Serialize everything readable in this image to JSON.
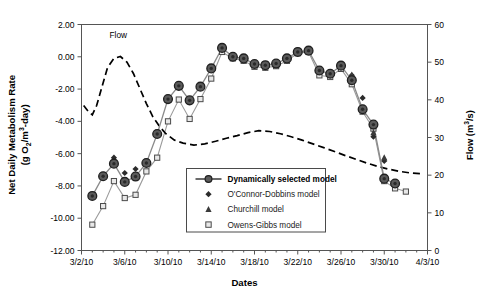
{
  "chart_data": {
    "type": "line",
    "title": "",
    "xlabel": "Dates",
    "ylabel": "Net Daily Metabolism Rate (g O2/m3-day)",
    "ylabel_line1": "Net Daily Metabolism Rate",
    "ylabel_line2": "(g O2/m3-day)",
    "y2label": "Flow (m3/s)",
    "xlim": [
      "3/2/10",
      "4/3/10"
    ],
    "x_tick_labels": [
      "3/2/10",
      "3/6/10",
      "3/10/10",
      "3/14/10",
      "3/18/10",
      "3/22/10",
      "3/26/10",
      "3/30/10",
      "4/3/10"
    ],
    "x_tick_days": [
      0,
      4,
      8,
      12,
      16,
      20,
      24,
      28,
      32
    ],
    "ylim": [
      -12.0,
      2.0
    ],
    "y_tick_labels": [
      "2.00",
      "0.00",
      "-2.00",
      "-4.00",
      "-6.00",
      "-8.00",
      "-10.00",
      "-12.00"
    ],
    "y_tick_values": [
      2.0,
      0.0,
      -2.0,
      -4.0,
      -6.0,
      -8.0,
      -10.0,
      -12.0
    ],
    "y2lim": [
      0,
      60
    ],
    "y2_tick_labels": [
      "60",
      "50",
      "40",
      "30",
      "20",
      "10",
      "0"
    ],
    "y2_tick_values": [
      60,
      50,
      40,
      30,
      20,
      10,
      0
    ],
    "grid": false,
    "legend_position": "lower-center",
    "annotations": [
      {
        "text": "Flow",
        "x": 3.4,
        "y": 1.15
      }
    ],
    "series": [
      {
        "name": "Dynamically selected model",
        "marker": "circle-filled",
        "line": true,
        "color": "#4d4d4d",
        "x": [
          1.0,
          2.0,
          3.0,
          4.0,
          5.0,
          6.0,
          7.0,
          8.0,
          9.0,
          10.0,
          11.0,
          12.0,
          13.0,
          14.0,
          15.0,
          16.0,
          17.0,
          18.0,
          19.0,
          20.0,
          21.0,
          22.0,
          23.0,
          24.0,
          25.0,
          26.0,
          27.0,
          28.0,
          29.0,
          30.0
        ],
        "y": [
          -8.62,
          -7.4,
          -6.62,
          -7.75,
          -7.42,
          -6.58,
          -4.78,
          -2.62,
          -1.8,
          -2.7,
          -1.85,
          -0.72,
          0.55,
          0.0,
          -0.1,
          -0.45,
          -0.52,
          -0.42,
          -0.1,
          0.3,
          0.38,
          -0.85,
          -1.05,
          -0.55,
          -1.45,
          -3.25,
          -4.2,
          -7.55,
          -7.85,
          null
        ]
      },
      {
        "name": "O'Connor-Dobbins model",
        "marker": "diamond",
        "line": false,
        "color": "#2b2b2b",
        "x": [
          2.0,
          3.0,
          4.0,
          5.0,
          6.0,
          25.0,
          26.0,
          27.0,
          28.0
        ],
        "y": [
          -7.4,
          -6.25,
          -7.2,
          -6.95,
          -6.58,
          -1.15,
          -2.55,
          -4.95,
          -6.45
        ]
      },
      {
        "name": "Churchill model",
        "marker": "triangle",
        "line": false,
        "color": "#3a3a3a",
        "x": [
          13.0,
          20.0,
          25.0,
          27.0,
          28.0
        ],
        "y": [
          0.55,
          0.38,
          -1.12,
          -4.7,
          -6.25
        ]
      },
      {
        "name": "Owens-Gibbs model",
        "marker": "square-open",
        "line": true,
        "color": "#9a9a9a",
        "x": [
          1.0,
          2.0,
          3.0,
          4.0,
          5.0,
          6.0,
          7.0,
          8.0,
          9.0,
          10.0,
          11.0,
          12.0,
          13.0,
          14.0,
          15.0,
          16.0,
          17.0,
          18.0,
          19.0,
          20.0,
          21.0,
          22.0,
          23.0,
          24.0,
          25.0,
          26.0,
          27.0,
          28.0,
          29.0,
          30.0
        ],
        "y": [
          -10.4,
          -9.25,
          -7.7,
          -8.75,
          -8.55,
          -7.1,
          -6.25,
          -4.0,
          -2.65,
          -3.85,
          -2.62,
          -1.35,
          0.3,
          -0.1,
          -0.25,
          -0.62,
          -0.68,
          -0.58,
          -0.25,
          0.22,
          0.3,
          -1.15,
          -1.25,
          -0.75,
          -1.7,
          -3.4,
          -4.45,
          -7.7,
          -8.15,
          -8.35
        ]
      },
      {
        "name": "Flow",
        "marker": "none",
        "line": true,
        "dashed": true,
        "color": "#000000",
        "axis": "right",
        "x": [
          0.2,
          0.6,
          1.0,
          1.4,
          1.9,
          2.4,
          3.0,
          3.6,
          4.2,
          4.8,
          5.4,
          6.0,
          6.6,
          7.2,
          7.8,
          8.6,
          9.4,
          10.4,
          11.4,
          12.4,
          13.4,
          14.4,
          15.4,
          16.4,
          17.4,
          18.4,
          19.4,
          20.4,
          21.4,
          22.4,
          23.4,
          24.4,
          25.4,
          26.4,
          27.4,
          28.4,
          29.4,
          30.4,
          31.4
        ],
        "y": [
          38.5,
          37.0,
          36.0,
          38.5,
          43.5,
          48.5,
          51.0,
          51.5,
          50.0,
          47.0,
          43.0,
          39.0,
          35.5,
          33.0,
          31.0,
          29.3,
          28.5,
          28.0,
          28.3,
          29.0,
          29.8,
          30.5,
          31.3,
          31.8,
          31.6,
          31.0,
          30.2,
          29.3,
          28.3,
          27.3,
          26.3,
          25.2,
          24.2,
          23.2,
          22.3,
          21.6,
          21.0,
          20.6,
          20.4
        ]
      }
    ]
  },
  "legend": {
    "entries": [
      {
        "label": "Dynamically selected model",
        "marker": "circle-line",
        "bold": true
      },
      {
        "label": "O'Connor-Dobbins model",
        "marker": "diamond",
        "bold": false
      },
      {
        "label": "Churchill model",
        "marker": "triangle",
        "bold": false
      },
      {
        "label": "Owens-Gibbs model",
        "marker": "square-open",
        "bold": false
      }
    ]
  }
}
